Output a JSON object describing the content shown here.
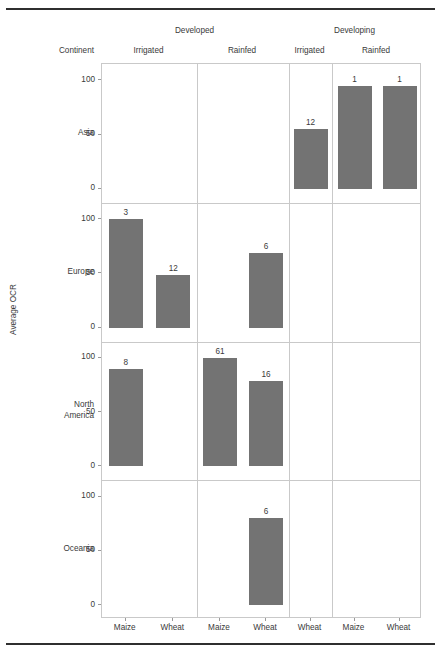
{
  "axis_titles": {
    "y": "Average OCR",
    "continent_header": "Continent"
  },
  "column_groups": [
    {
      "label": "Developed",
      "subs": [
        "Irrigated",
        "Rainfed"
      ]
    },
    {
      "label": "Developing",
      "subs": [
        "Irrigated",
        "Rainfed"
      ]
    }
  ],
  "colors": {
    "bar": "#737373",
    "grid": "#c9c9c9",
    "rule": "#2f2f2f",
    "text": "#3a3a3a"
  },
  "chart_data": {
    "type": "bar",
    "title": "",
    "xlabel": "",
    "ylabel": "Average OCR",
    "ylim": [
      0,
      115
    ],
    "yticks": [
      0,
      50,
      100
    ],
    "grid": false,
    "legend": null,
    "layout": "facet-grid rows=Continent cols=(Development x Water regime)",
    "row_facets": [
      "Asia",
      "Europe",
      "North America",
      "Oceania"
    ],
    "col_facets": [
      {
        "group": "Developed",
        "regime": "Irrigated",
        "crops": [
          "Maize",
          "Wheat"
        ]
      },
      {
        "group": "Developed",
        "regime": "Rainfed",
        "crops": [
          "Maize",
          "Wheat"
        ]
      },
      {
        "group": "Developing",
        "regime": "Irrigated",
        "crops": [
          "Wheat"
        ]
      },
      {
        "group": "Developing",
        "regime": "Rainfed",
        "crops": [
          "Maize",
          "Wheat"
        ]
      }
    ],
    "points": [
      {
        "continent": "Asia",
        "group": "Developing",
        "regime": "Irrigated",
        "crop": "Wheat",
        "value": 55,
        "label": "12"
      },
      {
        "continent": "Asia",
        "group": "Developing",
        "regime": "Rainfed",
        "crop": "Maize",
        "value": 95,
        "label": "1"
      },
      {
        "continent": "Asia",
        "group": "Developing",
        "regime": "Rainfed",
        "crop": "Wheat",
        "value": 95,
        "label": "1"
      },
      {
        "continent": "Europe",
        "group": "Developed",
        "regime": "Irrigated",
        "crop": "Maize",
        "value": 100,
        "label": "3"
      },
      {
        "continent": "Europe",
        "group": "Developed",
        "regime": "Irrigated",
        "crop": "Wheat",
        "value": 48,
        "label": "12"
      },
      {
        "continent": "Europe",
        "group": "Developed",
        "regime": "Rainfed",
        "crop": "Wheat",
        "value": 69,
        "label": "6"
      },
      {
        "continent": "North America",
        "group": "Developed",
        "regime": "Irrigated",
        "crop": "Maize",
        "value": 90,
        "label": "8"
      },
      {
        "continent": "North America",
        "group": "Developed",
        "regime": "Rainfed",
        "crop": "Maize",
        "value": 100,
        "label": "61"
      },
      {
        "continent": "North America",
        "group": "Developed",
        "regime": "Rainfed",
        "crop": "Wheat",
        "value": 79,
        "label": "16"
      },
      {
        "continent": "Oceania",
        "group": "Developed",
        "regime": "Rainfed",
        "crop": "Wheat",
        "value": 80,
        "label": "6"
      }
    ]
  },
  "rows": [
    {
      "label": "Asia",
      "yticks": [
        "100",
        "50",
        "0"
      ],
      "bars": [
        {
          "panel": 0,
          "slot": 0,
          "crop": "Maize",
          "value": null,
          "label": ""
        },
        {
          "panel": 0,
          "slot": 1,
          "crop": "Wheat",
          "value": null,
          "label": ""
        },
        {
          "panel": 1,
          "slot": 0,
          "crop": "Maize",
          "value": null,
          "label": ""
        },
        {
          "panel": 1,
          "slot": 1,
          "crop": "Wheat",
          "value": null,
          "label": ""
        },
        {
          "panel": 2,
          "slot": 0,
          "crop": "Wheat",
          "value": 55,
          "label": "12"
        },
        {
          "panel": 3,
          "slot": 0,
          "crop": "Maize",
          "value": 95,
          "label": "1"
        },
        {
          "panel": 3,
          "slot": 1,
          "crop": "Wheat",
          "value": 95,
          "label": "1"
        }
      ]
    },
    {
      "label": "Europe",
      "yticks": [
        "100",
        "50",
        "0"
      ],
      "bars": [
        {
          "panel": 0,
          "slot": 0,
          "crop": "Maize",
          "value": 100,
          "label": "3"
        },
        {
          "panel": 0,
          "slot": 1,
          "crop": "Wheat",
          "value": 48,
          "label": "12"
        },
        {
          "panel": 1,
          "slot": 0,
          "crop": "Maize",
          "value": null,
          "label": ""
        },
        {
          "panel": 1,
          "slot": 1,
          "crop": "Wheat",
          "value": 69,
          "label": "6"
        },
        {
          "panel": 2,
          "slot": 0,
          "crop": "Wheat",
          "value": null,
          "label": ""
        },
        {
          "panel": 3,
          "slot": 0,
          "crop": "Maize",
          "value": null,
          "label": ""
        },
        {
          "panel": 3,
          "slot": 1,
          "crop": "Wheat",
          "value": null,
          "label": ""
        }
      ]
    },
    {
      "label": "North America",
      "label_lines": [
        "North",
        "America"
      ],
      "yticks": [
        "100",
        "50",
        "0"
      ],
      "bars": [
        {
          "panel": 0,
          "slot": 0,
          "crop": "Maize",
          "value": 90,
          "label": "8"
        },
        {
          "panel": 0,
          "slot": 1,
          "crop": "Wheat",
          "value": null,
          "label": ""
        },
        {
          "panel": 1,
          "slot": 0,
          "crop": "Maize",
          "value": 100,
          "label": "61"
        },
        {
          "panel": 1,
          "slot": 1,
          "crop": "Wheat",
          "value": 79,
          "label": "16"
        },
        {
          "panel": 2,
          "slot": 0,
          "crop": "Wheat",
          "value": null,
          "label": ""
        },
        {
          "panel": 3,
          "slot": 0,
          "crop": "Maize",
          "value": null,
          "label": ""
        },
        {
          "panel": 3,
          "slot": 1,
          "crop": "Wheat",
          "value": null,
          "label": ""
        }
      ]
    },
    {
      "label": "Oceania",
      "yticks": [
        "100",
        "50",
        "0"
      ],
      "bars": [
        {
          "panel": 0,
          "slot": 0,
          "crop": "Maize",
          "value": null,
          "label": ""
        },
        {
          "panel": 0,
          "slot": 1,
          "crop": "Wheat",
          "value": null,
          "label": ""
        },
        {
          "panel": 1,
          "slot": 0,
          "crop": "Maize",
          "value": null,
          "label": ""
        },
        {
          "panel": 1,
          "slot": 1,
          "crop": "Wheat",
          "value": 80,
          "label": "6"
        },
        {
          "panel": 2,
          "slot": 0,
          "crop": "Wheat",
          "value": null,
          "label": ""
        },
        {
          "panel": 3,
          "slot": 0,
          "crop": "Maize",
          "value": null,
          "label": ""
        },
        {
          "panel": 3,
          "slot": 1,
          "crop": "Wheat",
          "value": null,
          "label": ""
        }
      ]
    }
  ],
  "xticks": [
    "Maize",
    "Wheat",
    "Maize",
    "Wheat",
    "Wheat",
    "Maize",
    "Wheat"
  ]
}
